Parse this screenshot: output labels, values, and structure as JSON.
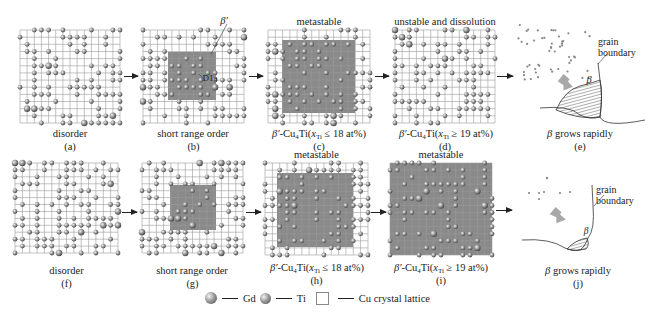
{
  "figure": {
    "rows": [
      {
        "panels": [
          {
            "id": "a",
            "caption": "(a)",
            "label": "disorder",
            "top_label": "",
            "x": 20,
            "y": 30,
            "w": 100,
            "h": 93,
            "shade": null,
            "seed": 11
          },
          {
            "id": "b",
            "caption": "(b)",
            "label": "short range order",
            "top_label": "",
            "x": 143,
            "y": 30,
            "w": 101,
            "h": 93,
            "shade": {
              "x": 25,
              "y": 22,
              "w": 48,
              "h": 48
            },
            "seed": 23,
            "annotations": {
              "beta_prime": "β′",
              "d1a": "D1a"
            }
          },
          {
            "id": "c",
            "caption": "(c)",
            "label_formula": {
              "phase": "β′",
              "compound": "-Cu",
              "sub4": "4",
              "ti": "Ti",
              "x": "x",
              "sub_ti": "Ti",
              "relation": "≤ 18 at%"
            },
            "top_label": "metastable",
            "x": 268,
            "y": 30,
            "w": 102,
            "h": 93,
            "shade": {
              "x": 14,
              "y": 10,
              "w": 73,
              "h": 73
            },
            "seed": 37
          },
          {
            "id": "d",
            "caption": "(d)",
            "label_formula": {
              "phase": "β′",
              "compound": "-Cu",
              "sub4": "4",
              "ti": "Ti",
              "x": "x",
              "sub_ti": "Ti",
              "relation": "≥ 19 at%"
            },
            "top_label": "unstable and dissolution",
            "x": 395,
            "y": 30,
            "w": 100,
            "h": 93,
            "shade": null,
            "seed": 53
          },
          {
            "id": "e",
            "caption": "(e)",
            "label_prefix": "β",
            "label": " grows rapidly",
            "grain_boundary": "grain\nboundary",
            "phase_label": "β"
          }
        ]
      },
      {
        "panels": [
          {
            "id": "f",
            "caption": "(f)",
            "label": "disorder",
            "top_label": "",
            "x": 15,
            "y": 163,
            "w": 103,
            "h": 90,
            "shade": null,
            "seed": 71
          },
          {
            "id": "g",
            "caption": "(g)",
            "label": "short range order",
            "top_label": "",
            "x": 142,
            "y": 163,
            "w": 101,
            "h": 90,
            "shade": {
              "x": 28,
              "y": 22,
              "w": 46,
              "h": 45
            },
            "seed": 89
          },
          {
            "id": "h",
            "caption": "(h)",
            "label_formula": {
              "phase": "β′",
              "compound": "-Cu",
              "sub4": "4",
              "ti": "Ti",
              "x": "x",
              "sub_ti": "Ti",
              "relation": "≤ 18 at%"
            },
            "top_label": "metastable",
            "x": 265,
            "y": 163,
            "w": 103,
            "h": 92,
            "shade": {
              "x": 12,
              "y": 10,
              "w": 76,
              "h": 74
            },
            "seed": 97
          },
          {
            "id": "i",
            "caption": "(i)",
            "label_formula": {
              "phase": "β′",
              "compound": "-Cu",
              "sub4": "4",
              "ti": "Ti",
              "x": "x",
              "sub_ti": "Ti",
              "relation": "≥ 19 at%"
            },
            "top_label": "metastable",
            "x": 390,
            "y": 163,
            "w": 102,
            "h": 92,
            "shade": {
              "x": 0,
              "y": 0,
              "w": 102,
              "h": 92
            },
            "seed": 113
          },
          {
            "id": "j",
            "caption": "(j)",
            "label_prefix": "β",
            "label": " grows rapidly",
            "grain_boundary": "grain\nboundary",
            "phase_label": "β"
          }
        ]
      }
    ],
    "legend": {
      "gd_label": "Gd",
      "ti_label": "Ti",
      "lattice_label": "Cu crystal lattice"
    },
    "colors": {
      "grid_line": "#9a9a9a",
      "shade": "#8a8a8a",
      "atom_light": "#f2f2f2",
      "atom_mid": "#9c9c9c",
      "atom_dark": "#4a4a4a",
      "text": "#222222"
    }
  }
}
